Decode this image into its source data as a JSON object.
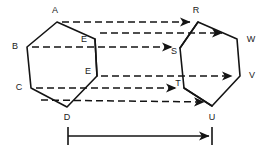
{
  "figure": {
    "background_color": "#ffffff",
    "stroke_color": "#141414",
    "label_color": "#1a1a1a",
    "width": 273,
    "height": 155
  },
  "left_hexagon": {
    "name": "left-hexagon",
    "vertices": [
      {
        "id": "A",
        "label": "A",
        "x": 57,
        "y": 22,
        "label_x": 55,
        "label_y": 11
      },
      {
        "id": "B",
        "label": "B",
        "x": 27,
        "y": 47,
        "label_x": 15,
        "label_y": 47
      },
      {
        "id": "C",
        "label": "C",
        "x": 31,
        "y": 88,
        "label_x": 19,
        "label_y": 88
      },
      {
        "id": "D",
        "label": "D",
        "x": 67,
        "y": 107,
        "label_x": 67,
        "label_y": 118
      },
      {
        "id": "E_lower",
        "label": "E",
        "x": 97,
        "y": 76,
        "label_x": 88,
        "label_y": 72
      },
      {
        "id": "E_upper",
        "label": "E",
        "x": 95,
        "y": 39,
        "label_x": 84,
        "label_y": 40
      }
    ]
  },
  "right_hexagon": {
    "name": "right-hexagon",
    "vertices": [
      {
        "id": "R",
        "label": "R",
        "x": 198,
        "y": 22,
        "label_x": 196,
        "label_y": 11
      },
      {
        "id": "W",
        "label": "W",
        "x": 237,
        "y": 39,
        "label_x": 251,
        "label_y": 40
      },
      {
        "id": "V",
        "label": "V",
        "x": 240,
        "y": 76,
        "label_x": 252,
        "label_y": 76
      },
      {
        "id": "U",
        "label": "U",
        "x": 212,
        "y": 106,
        "label_x": 212,
        "label_y": 118
      },
      {
        "id": "T",
        "label": "T",
        "x": 184,
        "y": 88,
        "label_x": 178,
        "label_y": 84
      },
      {
        "id": "S",
        "label": "S",
        "x": 180,
        "y": 48,
        "label_x": 174,
        "label_y": 52
      }
    ]
  },
  "translation_vectors": [
    {
      "id": "A-to-R",
      "from": "A",
      "to": "R",
      "x1": 62,
      "y1": 22,
      "x2": 194,
      "y2": 22
    },
    {
      "id": "E-to-RW",
      "from": "E_upper",
      "to": "RW",
      "x1": 100,
      "y1": 33,
      "x2": 226,
      "y2": 33
    },
    {
      "id": "B-to-S",
      "from": "B",
      "to": "S",
      "x1": 32,
      "y1": 47,
      "x2": 176,
      "y2": 47
    },
    {
      "id": "E-to-V",
      "from": "E_lower",
      "to": "V",
      "x1": 101,
      "y1": 76,
      "x2": 236,
      "y2": 76
    },
    {
      "id": "C-to-T",
      "from": "C",
      "to": "T",
      "x1": 36,
      "y1": 88,
      "x2": 180,
      "y2": 88
    },
    {
      "id": "D-to-U",
      "from": "D",
      "to": "U",
      "x1": 41,
      "y1": 100,
      "x2": 208,
      "y2": 103
    }
  ],
  "dimension": {
    "name": "translation-distance",
    "label": "",
    "x1": 68,
    "x2": 212,
    "y": 136,
    "tick_half_height": 9
  },
  "a11y": {
    "description": "Two congruent hexagons connected by six dashed arrows indicating a translation, with a dimension line below showing the translation distance."
  }
}
